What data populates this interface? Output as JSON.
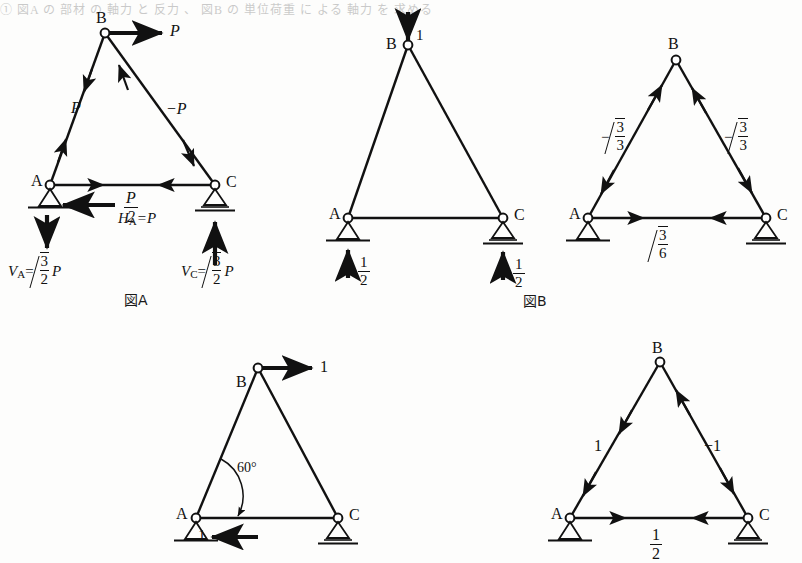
{
  "document": {
    "faint_header_text": "① 図A の 部材 の 軸力 と 反力 、 図B の 単位荷重 に よる 軸力 を 求める",
    "background_color": "#fdfdfc",
    "ink_color": "#111111"
  },
  "figures": [
    {
      "id": "fig-a",
      "caption": "図A",
      "nodes": [
        {
          "name": "A",
          "label": "A",
          "support": "pin"
        },
        {
          "name": "B",
          "label": "B",
          "support": "none"
        },
        {
          "name": "C",
          "label": "C",
          "support": "roller"
        }
      ],
      "applied_loads": [
        {
          "name": "load-at-b",
          "label": "P",
          "direction": "right",
          "at": "B"
        }
      ],
      "member_forces": [
        {
          "member": "AB",
          "label": "P",
          "sign": "positive"
        },
        {
          "member": "BC",
          "label": "−P",
          "sign": "negative"
        },
        {
          "member": "AC",
          "label_num": "P",
          "label_den": "2",
          "sign": "positive"
        }
      ],
      "reactions": [
        {
          "name": "reaction-ha",
          "label": "H",
          "sub": "A",
          "eq": "=P",
          "direction": "left"
        },
        {
          "name": "reaction-va",
          "label": "V",
          "sub": "A",
          "eq": "=",
          "num": "3",
          "den": "2",
          "tail": "P",
          "direction": "down"
        },
        {
          "name": "reaction-vc",
          "label": "V",
          "sub": "C",
          "eq": "=",
          "num": "3",
          "den": "2",
          "tail": "P",
          "direction": "up"
        }
      ]
    },
    {
      "id": "fig-b-left",
      "caption": "図B",
      "nodes": [
        {
          "name": "A",
          "label": "A",
          "support": "pin"
        },
        {
          "name": "B",
          "label": "B",
          "support": "none"
        },
        {
          "name": "C",
          "label": "C",
          "support": "roller"
        }
      ],
      "applied_loads": [
        {
          "name": "unit-load-at-b",
          "label": "1",
          "direction": "down",
          "at": "B"
        }
      ],
      "member_forces": [],
      "reactions": [
        {
          "name": "reaction-va",
          "num": "1",
          "den": "2",
          "direction": "up"
        },
        {
          "name": "reaction-vc",
          "num": "1",
          "den": "2",
          "direction": "up"
        }
      ]
    },
    {
      "id": "fig-b-right",
      "caption": "",
      "nodes": [
        {
          "name": "A",
          "label": "A",
          "support": "pin"
        },
        {
          "name": "B",
          "label": "B",
          "support": "none"
        },
        {
          "name": "C",
          "label": "C",
          "support": "roller"
        }
      ],
      "applied_loads": [],
      "member_forces": [
        {
          "member": "AB",
          "prefix": "−",
          "num": "3",
          "den": "3",
          "radical": true,
          "sign": "negative"
        },
        {
          "member": "BC",
          "prefix": "−",
          "num": "3",
          "den": "3",
          "radical": true,
          "sign": "negative"
        },
        {
          "member": "AC",
          "prefix": "",
          "num": "3",
          "den": "6",
          "radical": true,
          "sign": "positive"
        }
      ],
      "reactions": []
    },
    {
      "id": "fig-c-left",
      "caption": "",
      "nodes": [
        {
          "name": "A",
          "label": "A",
          "support": "pin"
        },
        {
          "name": "B",
          "label": "B",
          "support": "none"
        },
        {
          "name": "C",
          "label": "C",
          "support": "roller"
        }
      ],
      "applied_loads": [
        {
          "name": "unit-load-at-b",
          "label": "1",
          "direction": "right",
          "at": "B"
        }
      ],
      "annotations": [
        {
          "name": "angle-a",
          "label": "60°"
        }
      ],
      "reactions": [
        {
          "name": "reaction-ha",
          "label": "1",
          "direction": "left"
        }
      ]
    },
    {
      "id": "fig-c-right",
      "caption": "",
      "nodes": [
        {
          "name": "A",
          "label": "A",
          "support": "pin"
        },
        {
          "name": "B",
          "label": "B",
          "support": "none"
        },
        {
          "name": "C",
          "label": "C",
          "support": "roller"
        }
      ],
      "applied_loads": [],
      "member_forces": [
        {
          "member": "AB",
          "label": "1",
          "sign": "positive"
        },
        {
          "member": "BC",
          "label": "−1",
          "sign": "negative"
        },
        {
          "member": "AC",
          "num": "1",
          "den": "2",
          "sign": "positive"
        }
      ],
      "reactions": []
    }
  ]
}
